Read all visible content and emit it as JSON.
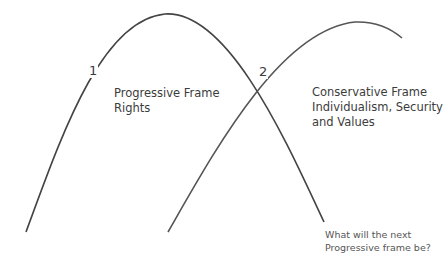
{
  "diagram": {
    "type": "overlapping-arcs",
    "curves": [
      {
        "id": "progressive",
        "label": "1",
        "color": "#444444"
      },
      {
        "id": "conservative",
        "label": "2",
        "color": "#555555"
      }
    ],
    "progressive_frame": {
      "title": "Progressive Frame",
      "subtitle": "Rights"
    },
    "conservative_frame": {
      "title": "Conservative Frame",
      "line2": "Individualism, Security",
      "line3": "and Values"
    },
    "question": {
      "line1": "What will the next",
      "line2": "Progressive frame be?"
    }
  }
}
